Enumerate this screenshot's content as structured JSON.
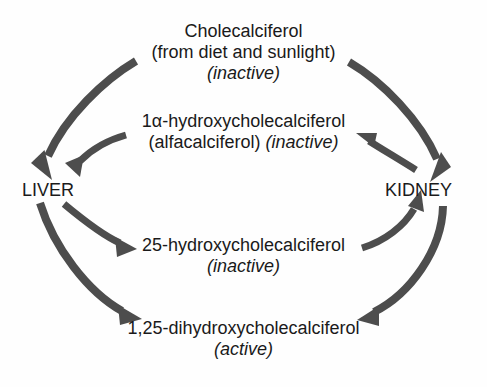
{
  "diagram": {
    "background_color": "#fefefe",
    "text_color": "#1a1a1a",
    "arrow_color": "#4d4d4d",
    "nodes": [
      {
        "id": "cholecalciferol",
        "line1": "Cholecalciferol",
        "line2": "(from diet and sunlight)",
        "line3": "(inactive)"
      },
      {
        "id": "alfacalciferol",
        "line1": "1α-hydroxycholecalciferol",
        "line2a": "(alfacalciferol) ",
        "line2b": "(inactive)"
      },
      {
        "id": "hydroxycholecalciferol-25",
        "line1": "25-hydroxycholecalciferol",
        "line2": "(inactive)"
      },
      {
        "id": "dihydroxycholecalciferol-125",
        "line1": "1,25-dihydroxycholecalciferol",
        "line2": "(active)"
      }
    ],
    "organs": [
      {
        "id": "liver",
        "label": "LIVER"
      },
      {
        "id": "kidney",
        "label": "KIDNEY"
      }
    ],
    "arrows": [
      {
        "id": "cholecalciferol-to-liver",
        "from": "Cholecalciferol",
        "to": "LIVER"
      },
      {
        "id": "cholecalciferol-to-kidney",
        "from": "Cholecalciferol",
        "to": "KIDNEY"
      },
      {
        "id": "alfacalciferol-to-liver",
        "from": "1α-hydroxycholecalciferol",
        "to": "LIVER"
      },
      {
        "id": "kidney-to-alfacalciferol",
        "from": "KIDNEY",
        "to": "1α-hydroxycholecalciferol"
      },
      {
        "id": "liver-to-25hydroxy",
        "from": "LIVER",
        "to": "25-hydroxycholecalciferol"
      },
      {
        "id": "25hydroxy-to-kidney",
        "from": "25-hydroxycholecalciferol",
        "to": "KIDNEY"
      },
      {
        "id": "liver-to-125dihydroxy",
        "from": "LIVER",
        "to": "1,25-dihydroxycholecalciferol"
      },
      {
        "id": "kidney-to-125dihydroxy",
        "from": "KIDNEY",
        "to": "1,25-dihydroxycholecalciferol"
      }
    ]
  }
}
